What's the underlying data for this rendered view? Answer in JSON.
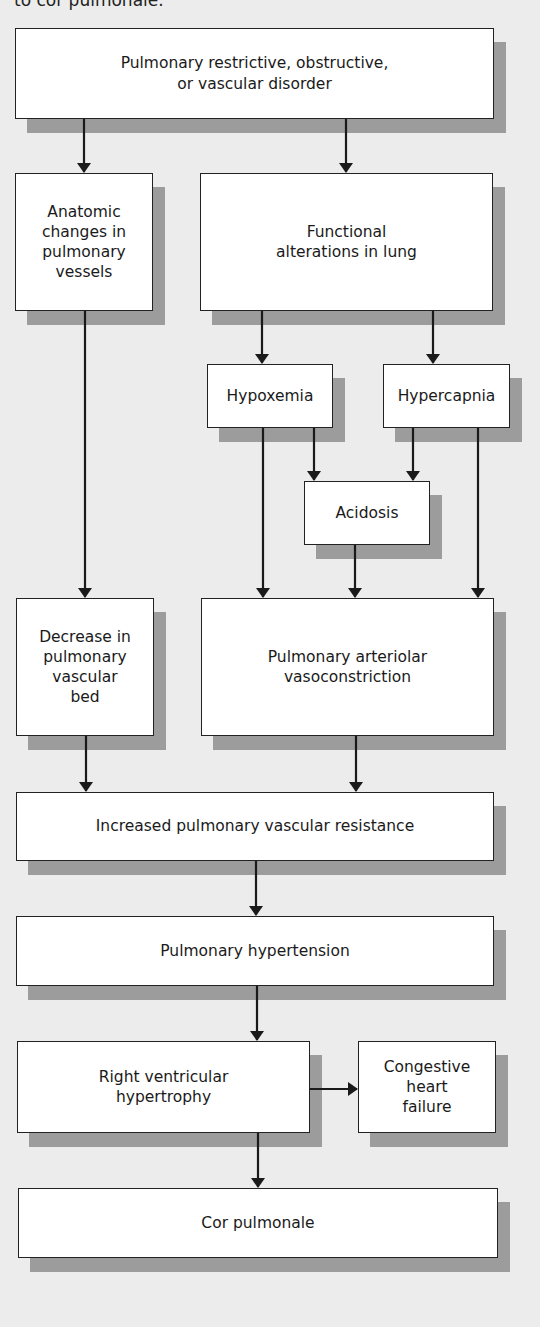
{
  "caption": "to cor pulmonale.",
  "nodes": {
    "disorder": "Pulmonary restrictive, obstructive,\nor vascular disorder",
    "anatomic": "Anatomic\nchanges in\npulmonary\nvessels",
    "functional": "Functional\nalterations in lung",
    "hypoxemia": "Hypoxemia",
    "hypercapnia": "Hypercapnia",
    "acidosis": "Acidosis",
    "decrease_bed": "Decrease in\npulmonary\nvascular\nbed",
    "vasoconstriction": "Pulmonary arteriolar\nvasoconstriction",
    "resistance": "Increased pulmonary vascular resistance",
    "hypertension": "Pulmonary hypertension",
    "rv_hypertrophy": "Right ventricular\nhypertrophy",
    "chf": "Congestive\nheart\nfailure",
    "cor_pulmonale": "Cor pulmonale"
  },
  "edges": [
    {
      "from": "disorder",
      "to": "anatomic"
    },
    {
      "from": "disorder",
      "to": "functional"
    },
    {
      "from": "functional",
      "to": "hypoxemia"
    },
    {
      "from": "functional",
      "to": "hypercapnia"
    },
    {
      "from": "hypoxemia",
      "to": "acidosis"
    },
    {
      "from": "hypercapnia",
      "to": "acidosis"
    },
    {
      "from": "hypoxemia",
      "to": "vasoconstriction"
    },
    {
      "from": "acidosis",
      "to": "vasoconstriction"
    },
    {
      "from": "hypercapnia",
      "to": "vasoconstriction"
    },
    {
      "from": "anatomic",
      "to": "decrease_bed"
    },
    {
      "from": "decrease_bed",
      "to": "resistance"
    },
    {
      "from": "vasoconstriction",
      "to": "resistance"
    },
    {
      "from": "resistance",
      "to": "hypertension"
    },
    {
      "from": "hypertension",
      "to": "rv_hypertrophy"
    },
    {
      "from": "rv_hypertrophy",
      "to": "chf"
    },
    {
      "from": "rv_hypertrophy",
      "to": "cor_pulmonale"
    }
  ],
  "colors": {
    "background": "#ececec",
    "box_fill": "#ffffff",
    "box_border": "#222222",
    "shadow": "#9c9c9c",
    "arrow": "#1a1a1a"
  }
}
